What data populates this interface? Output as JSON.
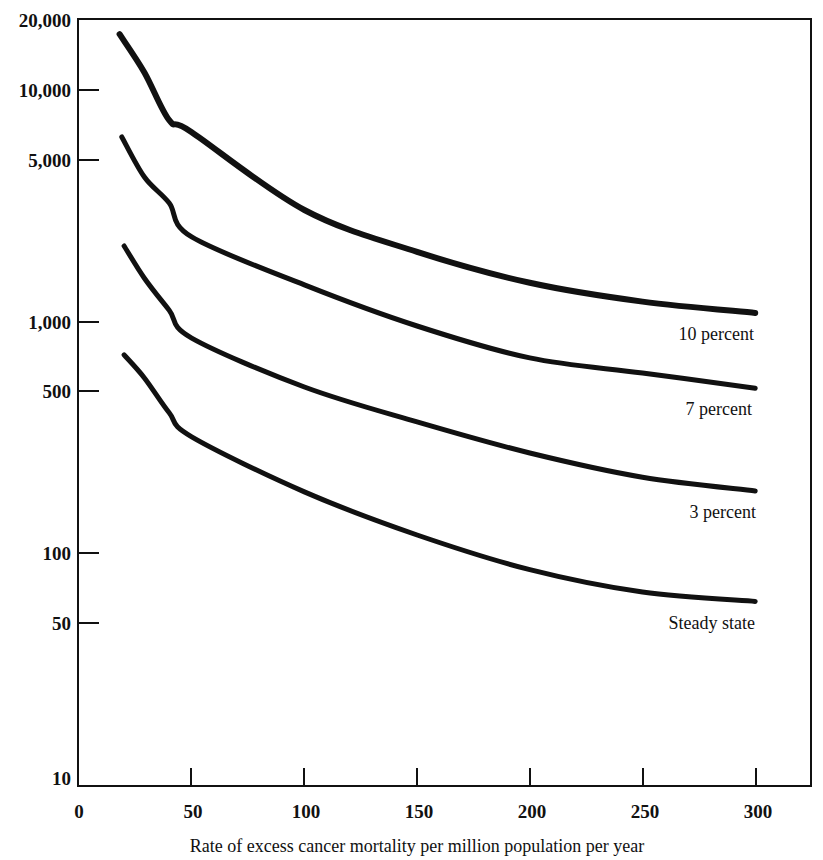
{
  "chart_data": {
    "type": "line",
    "title": "",
    "xlabel": "Rate of excess cancer mortality per million population per year",
    "ylabel": "",
    "yscale": "log",
    "xlim": [
      0,
      325
    ],
    "ylim": [
      10,
      20000
    ],
    "grid": false,
    "legend_position": "inline labels at right end of each curve",
    "x_ticks": [
      0,
      50,
      100,
      150,
      200,
      250,
      300
    ],
    "x_tick_labels": [
      "0",
      "50",
      "100",
      "150",
      "200",
      "250",
      "300"
    ],
    "y_ticks": [
      10,
      50,
      100,
      500,
      1000,
      5000,
      10000,
      20000
    ],
    "y_tick_labels": [
      "10",
      "50",
      "100",
      "500",
      "1,000",
      "5,000",
      "10,000",
      "20,000"
    ],
    "series": [
      {
        "name": "10 percent",
        "x": [
          18,
          29,
          40,
          50,
          100,
          150,
          200,
          250,
          300
        ],
        "values": [
          17400,
          11900,
          7400,
          6570,
          3030,
          2000,
          1470,
          1220,
          1090
        ]
      },
      {
        "name": "7 percent",
        "x": [
          19,
          29,
          40,
          50,
          100,
          150,
          200,
          250,
          300
        ],
        "values": [
          6270,
          4210,
          3250,
          2320,
          1440,
          957,
          697,
          600,
          516
        ]
      },
      {
        "name": "3 percent",
        "x": [
          20,
          29,
          40,
          50,
          100,
          150,
          200,
          250,
          300
        ],
        "values": [
          2120,
          1540,
          1120,
          849,
          522,
          369,
          271,
          213,
          186
        ]
      },
      {
        "name": "Steady state",
        "x": [
          20,
          29,
          40,
          50,
          100,
          150,
          200,
          250,
          300
        ],
        "values": [
          718,
          571,
          404,
          318,
          184,
          120,
          85,
          68,
          62
        ]
      }
    ]
  },
  "labels": {
    "series_10": "10 percent",
    "series_7": "7 percent",
    "series_3": "3 percent",
    "series_steady": "Steady state",
    "x_axis_title": "Rate of excess cancer mortality per million population per year",
    "y_ticks": [
      "20,000",
      "10,000",
      "5,000",
      "1,000",
      "500",
      "100",
      "50",
      "10"
    ],
    "x_ticks": [
      "0",
      "50",
      "100",
      "150",
      "200",
      "250",
      "300"
    ]
  }
}
